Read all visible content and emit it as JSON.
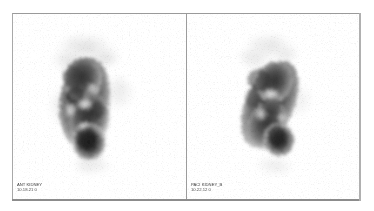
{
  "viewer": {
    "title": "Scintigraphy Dual Panel Viewer",
    "background_color": "#ffffff",
    "frame_border_color": "#9a9a9a",
    "divider_color": "#9c9c9c"
  },
  "panels": [
    {
      "id": "panel-left",
      "position": "left",
      "annotation": {
        "line1": "ANT KIDNEY",
        "line2": "10.18.21 0"
      },
      "scan": {
        "modality": "planar-scintigraphy",
        "colormap": "grayscale-inverted",
        "organ_shape": "kidney-vertical-bilobed",
        "orientation_deg": 8,
        "center_x_pct": 41,
        "center_y_pct": 50,
        "width_pct": 27,
        "height_pct": 52,
        "peak_intensity": 0.86,
        "background_haze_intensity": 0.06,
        "cold_spot_count": 3,
        "hot_lobe": "inferior"
      }
    },
    {
      "id": "panel-right",
      "position": "right",
      "annotation": {
        "line1": "PACI KIDNEY_B",
        "line2": "10.22.12 0"
      },
      "scan": {
        "modality": "planar-scintigraphy",
        "colormap": "grayscale-inverted",
        "organ_shape": "kidney-oval-oblique",
        "orientation_deg": 24,
        "center_x_pct": 46,
        "center_y_pct": 48,
        "width_pct": 25,
        "height_pct": 50,
        "peak_intensity": 0.82,
        "background_haze_intensity": 0.05,
        "cold_spot_count": 2,
        "hot_lobe": "inferior"
      }
    }
  ]
}
